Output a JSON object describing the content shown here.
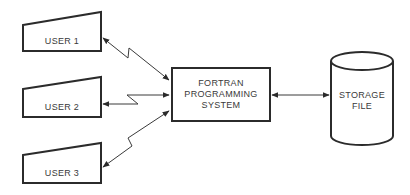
{
  "diagram": {
    "users": [
      {
        "label": "USER 1"
      },
      {
        "label": "USER 2"
      },
      {
        "label": "USER 3"
      }
    ],
    "system": {
      "lines": [
        "FORTRAN",
        "PROGRAMMING",
        "SYSTEM"
      ]
    },
    "storage": {
      "lines": [
        "STORAGE",
        "FILE"
      ]
    },
    "connections": [
      {
        "from": "USER 1",
        "to": "FORTRAN PROGRAMMING SYSTEM",
        "style": "zigzag",
        "direction": "bidirectional"
      },
      {
        "from": "USER 2",
        "to": "FORTRAN PROGRAMMING SYSTEM",
        "style": "zigzag",
        "direction": "bidirectional"
      },
      {
        "from": "USER 3",
        "to": "FORTRAN PROGRAMMING SYSTEM",
        "style": "zigzag",
        "direction": "bidirectional"
      },
      {
        "from": "FORTRAN PROGRAMMING SYSTEM",
        "to": "STORAGE FILE",
        "style": "straight",
        "direction": "bidirectional"
      }
    ],
    "colors": {
      "stroke": "#2b2b2b",
      "text": "#3a3a3a",
      "background": "#ffffff"
    }
  }
}
